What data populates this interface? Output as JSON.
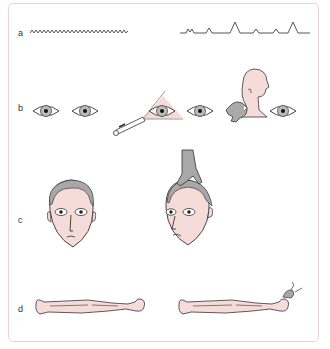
{
  "figure": {
    "rows": [
      {
        "label": "a",
        "panels": [
          "eeg-activity-trace",
          "flat-eeg-trace-with-artifacts"
        ]
      },
      {
        "label": "b",
        "panels": [
          "pupils",
          "pupil-light-reflex-penlight",
          "pupil-response-neck-pinch"
        ]
      },
      {
        "label": "c",
        "panels": [
          "face-frontal",
          "face-head-turned-oculocephalic"
        ]
      },
      {
        "label": "d",
        "panels": [
          "supine-body",
          "supine-body-apnea-test"
        ]
      }
    ],
    "colors": {
      "skin": "#f6dcd8",
      "hair": "#a8a8a8",
      "line": "#333333",
      "frame": "#ecd4d0",
      "light_cone": "#f7d9d6"
    }
  }
}
